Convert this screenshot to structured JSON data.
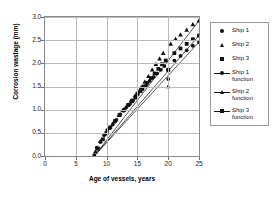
{
  "chart_data": {
    "type": "scatter",
    "title": "",
    "xlabel": "Age of vessels, years",
    "ylabel": "Corrosion wastage (mm)",
    "xlim": [
      0,
      25
    ],
    "ylim": [
      0,
      3.0
    ],
    "xticks": [
      0,
      5,
      10,
      15,
      20,
      25
    ],
    "yticks": [
      "0.0",
      "0.5",
      "1.0",
      "1.5",
      "2.0",
      "2.5",
      "3.0"
    ],
    "xtick_labels": [
      "0",
      "5",
      "10",
      "15",
      "20",
      "25"
    ],
    "grid": true,
    "legend_position": "right",
    "series": [
      {
        "name": "Ship 1",
        "marker": "circle",
        "kind": "scatter",
        "points": [
          [
            8.0,
            0.02
          ],
          [
            8.4,
            0.18
          ],
          [
            9.0,
            0.3
          ],
          [
            9.6,
            0.45
          ],
          [
            10.0,
            0.5
          ],
          [
            10.1,
            0.56
          ],
          [
            11.0,
            0.68
          ],
          [
            11.6,
            0.78
          ],
          [
            12.2,
            0.9
          ],
          [
            12.8,
            0.98
          ],
          [
            13.2,
            1.05
          ],
          [
            13.8,
            1.12
          ],
          [
            14.3,
            1.2
          ],
          [
            14.8,
            1.28
          ],
          [
            15.0,
            1.32
          ],
          [
            15.2,
            1.38
          ],
          [
            15.8,
            1.44
          ],
          [
            16.4,
            1.52
          ],
          [
            17.0,
            1.62
          ],
          [
            17.6,
            1.7
          ],
          [
            18.2,
            1.78
          ],
          [
            18.8,
            1.86
          ],
          [
            19.4,
            1.94
          ],
          [
            20.0,
            1.85
          ],
          [
            20.0,
            1.66
          ],
          [
            21.0,
            2.06
          ],
          [
            22.0,
            2.16
          ],
          [
            23.0,
            2.28
          ],
          [
            24.0,
            2.38
          ],
          [
            25.0,
            2.46
          ]
        ]
      },
      {
        "name": "Ship 2",
        "marker": "triangle",
        "kind": "scatter",
        "points": [
          [
            8.2,
            0.1
          ],
          [
            9.0,
            0.32
          ],
          [
            9.8,
            0.48
          ],
          [
            10.4,
            0.6
          ],
          [
            11.2,
            0.74
          ],
          [
            12.0,
            0.88
          ],
          [
            12.6,
            0.98
          ],
          [
            13.4,
            1.1
          ],
          [
            14.0,
            1.2
          ],
          [
            14.6,
            1.3
          ],
          [
            15.0,
            1.36
          ],
          [
            15.6,
            1.48
          ],
          [
            16.2,
            1.6
          ],
          [
            16.8,
            1.72
          ],
          [
            17.4,
            1.86
          ],
          [
            18.0,
            1.98
          ],
          [
            18.6,
            2.1
          ],
          [
            19.2,
            2.22
          ],
          [
            20.0,
            1.5
          ],
          [
            20.4,
            2.42
          ],
          [
            21.2,
            2.52
          ],
          [
            22.0,
            2.62
          ],
          [
            23.0,
            2.72
          ],
          [
            24.0,
            2.84
          ],
          [
            25.0,
            2.92
          ]
        ]
      },
      {
        "name": "Ship 3",
        "marker": "square",
        "kind": "scatter",
        "points": [
          [
            8.6,
            0.16
          ],
          [
            9.4,
            0.36
          ],
          [
            10.0,
            0.5
          ],
          [
            10.6,
            0.62
          ],
          [
            11.4,
            0.76
          ],
          [
            12.1,
            0.88
          ],
          [
            12.9,
            1.0
          ],
          [
            13.5,
            1.1
          ],
          [
            14.1,
            1.18
          ],
          [
            14.7,
            1.26
          ],
          [
            15.0,
            1.34
          ],
          [
            15.5,
            1.4
          ],
          [
            16.0,
            1.5
          ],
          [
            16.6,
            1.58
          ],
          [
            17.2,
            1.68
          ],
          [
            17.8,
            1.78
          ],
          [
            18.4,
            1.88
          ],
          [
            19.0,
            1.98
          ],
          [
            19.6,
            2.06
          ],
          [
            20.0,
            1.86
          ],
          [
            21.0,
            2.22
          ],
          [
            22.0,
            2.32
          ],
          [
            23.0,
            2.42
          ],
          [
            24.0,
            2.52
          ],
          [
            25.0,
            2.6
          ]
        ]
      },
      {
        "name": "Ship 1 function",
        "marker": "circle",
        "kind": "line",
        "points": [
          [
            8.0,
            0.0
          ],
          [
            25.0,
            2.46
          ]
        ]
      },
      {
        "name": "Ship 2 function",
        "marker": "triangle",
        "kind": "line",
        "points": [
          [
            8.0,
            0.0
          ],
          [
            25.0,
            2.92
          ]
        ]
      },
      {
        "name": "Ship 3 function",
        "marker": "square",
        "kind": "line",
        "points": [
          [
            8.0,
            0.0
          ],
          [
            25.0,
            2.6
          ]
        ]
      }
    ]
  },
  "axes": {
    "ylabel": "Corrosion wastage (mm)",
    "xlabel": "Age of vessels, years",
    "ytick_labels": [
      "3.0",
      "2.5",
      "2.0",
      "1.5",
      "1.0",
      "0.5",
      "0.0"
    ],
    "xtick_labels": [
      "0",
      "5",
      "10",
      "15",
      "20",
      "25"
    ]
  },
  "legend": {
    "items": [
      {
        "label": "Ship 1",
        "marker": "circle",
        "line": false
      },
      {
        "label": "Ship 2",
        "marker": "triangle",
        "line": false
      },
      {
        "label": "Ship 3",
        "marker": "square",
        "line": false
      },
      {
        "label": "Ship 1\nfunction",
        "marker": "circle",
        "line": true
      },
      {
        "label": "Ship 2\nfunction",
        "marker": "triangle",
        "line": true
      },
      {
        "label": "Ship 3\nfunction",
        "marker": "square",
        "line": true
      }
    ]
  },
  "colors": {
    "marker": "#111111",
    "line": "#111111",
    "grid": "#b9b9b9",
    "axis": "#8a8a8a",
    "background": "#ffffff"
  }
}
